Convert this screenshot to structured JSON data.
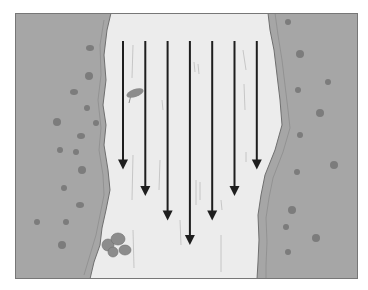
{
  "diagram": {
    "flow_direction": "down",
    "arrows": [
      {
        "id": 1,
        "relative_length": 0.63
      },
      {
        "id": 2,
        "relative_length": 0.76
      },
      {
        "id": 3,
        "relative_length": 0.88
      },
      {
        "id": 4,
        "relative_length": 1.0
      },
      {
        "id": 5,
        "relative_length": 0.88
      },
      {
        "id": 6,
        "relative_length": 0.76
      },
      {
        "id": 7,
        "relative_length": 0.63
      }
    ],
    "features": [
      "left-bank",
      "right-bank",
      "water-channel",
      "floating-leaf",
      "bank-shrub",
      "grass-tufts",
      "current-streaks"
    ],
    "colors": {
      "bank": "#a6a6a6",
      "bank_edge": "#9a9a9a",
      "bank_outline": "#6f6f6f",
      "water": "#ececec",
      "arrow": "#1e1e1e",
      "grass": "#7c7c7c",
      "shrub": "#8c8c8c",
      "frame": "#777777",
      "streak": "#bdbdbd"
    }
  }
}
